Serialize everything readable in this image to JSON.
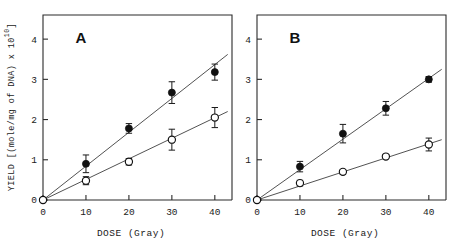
{
  "figure": {
    "ylabel_main": "YIELD [(mole/mg of DNA) x 10",
    "ylabel_exponent": "10",
    "ylabel_close": "]",
    "ylabel_full": "YIELD [(mole/mg of DNA) x 10^10]"
  },
  "panels": [
    {
      "letter": "A",
      "xlabel": "DOSE (Gray)",
      "xticks": [
        "0",
        "10",
        "20",
        "30",
        "40"
      ],
      "yticks": [
        "0",
        "1",
        "2",
        "3",
        "4"
      ]
    },
    {
      "letter": "B",
      "xlabel": "DOSE (Gray)",
      "xticks": [
        "0",
        "10",
        "20",
        "30",
        "40"
      ],
      "yticks": [
        "0",
        "1",
        "2",
        "3",
        "4"
      ]
    }
  ],
  "chart_data": [
    {
      "type": "scatter",
      "title": "A",
      "xlabel": "DOSE (Gray)",
      "ylabel": "YIELD [(mole/mg of DNA) x 10^10]",
      "xlim": [
        0,
        44
      ],
      "ylim": [
        0,
        4.6
      ],
      "xticks": [
        0,
        10,
        20,
        30,
        40
      ],
      "yticks": [
        0,
        1,
        2,
        3,
        4
      ],
      "grid": false,
      "legend": "none",
      "series": [
        {
          "name": "filled-circles",
          "marker": "filled-circle",
          "x": [
            0,
            10,
            20,
            30,
            40
          ],
          "values": [
            0.0,
            0.9,
            1.78,
            2.67,
            3.18
          ],
          "yerr": [
            0.0,
            0.22,
            0.12,
            0.27,
            0.2
          ],
          "fit_line": {
            "x": [
              0,
              43
            ],
            "y": [
              0.0,
              3.62
            ]
          }
        },
        {
          "name": "open-circles",
          "marker": "open-circle",
          "x": [
            0,
            10,
            20,
            30,
            40
          ],
          "values": [
            0.0,
            0.48,
            0.95,
            1.5,
            2.05
          ],
          "yerr": [
            0.0,
            0.1,
            0.08,
            0.26,
            0.25
          ],
          "fit_line": {
            "x": [
              0,
              43
            ],
            "y": [
              0.0,
              2.2
            ]
          }
        }
      ]
    },
    {
      "type": "scatter",
      "title": "B",
      "xlabel": "DOSE (Gray)",
      "ylabel": "YIELD [(mole/mg of DNA) x 10^10]",
      "xlim": [
        0,
        44
      ],
      "ylim": [
        0,
        4.6
      ],
      "xticks": [
        0,
        10,
        20,
        30,
        40
      ],
      "yticks": [
        0,
        1,
        2,
        3,
        4
      ],
      "grid": false,
      "legend": "none",
      "series": [
        {
          "name": "filled-circles",
          "marker": "filled-circle",
          "x": [
            0,
            10,
            20,
            30,
            40
          ],
          "values": [
            0.0,
            0.83,
            1.65,
            2.28,
            3.0
          ],
          "yerr": [
            0.0,
            0.13,
            0.23,
            0.17,
            0.07
          ],
          "fit_line": {
            "x": [
              0,
              43
            ],
            "y": [
              0.0,
              3.25
            ]
          }
        },
        {
          "name": "open-circles",
          "marker": "open-circle",
          "x": [
            0,
            10,
            20,
            30,
            40
          ],
          "values": [
            0.0,
            0.42,
            0.7,
            1.08,
            1.38
          ],
          "yerr": [
            0.0,
            0.07,
            0.06,
            0.05,
            0.16
          ],
          "fit_line": {
            "x": [
              0,
              43
            ],
            "y": [
              0.0,
              1.5
            ]
          }
        }
      ]
    }
  ]
}
